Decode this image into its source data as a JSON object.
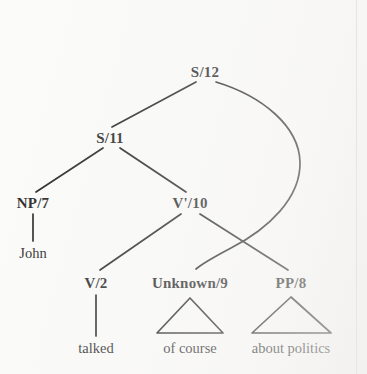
{
  "figure": {
    "kind": "syntax-tree",
    "ink_color": "#1a1a1a",
    "background_color": "#fbfbfa"
  },
  "nodes": [
    {
      "id": "s12",
      "label": "S/12",
      "x": 205,
      "y": 72,
      "type": "nonterminal"
    },
    {
      "id": "s11",
      "label": "S/11",
      "x": 110,
      "y": 138,
      "type": "nonterminal"
    },
    {
      "id": "np7",
      "label": "NP/7",
      "x": 33,
      "y": 203,
      "type": "nonterminal"
    },
    {
      "id": "vbar10",
      "label": "V'/10",
      "x": 190,
      "y": 203,
      "type": "nonterminal"
    },
    {
      "id": "v2",
      "label": "V/2",
      "x": 96,
      "y": 283,
      "type": "nonterminal"
    },
    {
      "id": "unknown9",
      "label": "Unknown/9",
      "x": 190,
      "y": 283,
      "type": "nonterminal"
    },
    {
      "id": "pp8",
      "label": "PP/8",
      "x": 291,
      "y": 283,
      "type": "nonterminal"
    }
  ],
  "leaves": [
    {
      "id": "john",
      "label": "John",
      "x": 33,
      "y": 253
    },
    {
      "id": "talked",
      "label": "talked",
      "x": 96,
      "y": 348
    },
    {
      "id": "of_course",
      "label": "of course",
      "x": 190,
      "y": 348
    },
    {
      "id": "about_politics",
      "label": "about politics",
      "x": 291,
      "y": 348
    }
  ],
  "edges": [
    {
      "id": "s12-s11",
      "from": "s12",
      "to": "s11",
      "shape": "line"
    },
    {
      "id": "s12-unknown9",
      "from": "s12",
      "to": "unknown9",
      "shape": "curve",
      "note": "long right-sweeping curve crossing the V'/10 to PP/8 branch"
    },
    {
      "id": "s11-np7",
      "from": "s11",
      "to": "np7",
      "shape": "line"
    },
    {
      "id": "s11-vbar10",
      "from": "s11",
      "to": "vbar10",
      "shape": "line"
    },
    {
      "id": "np7-john",
      "from": "np7",
      "to": "john",
      "shape": "vertical"
    },
    {
      "id": "vbar10-v2",
      "from": "vbar10",
      "to": "v2",
      "shape": "line"
    },
    {
      "id": "vbar10-pp8",
      "from": "vbar10",
      "to": "pp8",
      "shape": "line"
    },
    {
      "id": "v2-talked",
      "from": "v2",
      "to": "talked",
      "shape": "vertical"
    }
  ],
  "triangles": [
    {
      "id": "triangle-unknown9",
      "for": "unknown9",
      "apex_x": 190,
      "apex_y": 298,
      "left_x": 157,
      "right_x": 223,
      "base_y": 333
    },
    {
      "id": "triangle-pp8",
      "for": "pp8",
      "apex_x": 291,
      "apex_y": 297,
      "left_x": 252,
      "right_x": 331,
      "base_y": 333
    }
  ]
}
